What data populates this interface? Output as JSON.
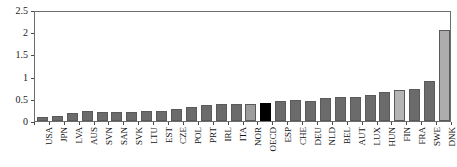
{
  "chart_data": {
    "type": "bar",
    "title": "",
    "subtitle": "",
    "xlabel": "",
    "ylabel": "",
    "ylim": [
      0,
      2.5
    ],
    "yticks": [
      0,
      0.5,
      1,
      1.5,
      2,
      2.5
    ],
    "ytick_labels": [
      "0",
      "0.5",
      "1",
      "1.5",
      "2",
      "2.5"
    ],
    "grid": false,
    "legend": null,
    "categories": [
      "USA",
      "JPN",
      "LVA",
      "AUS",
      "SVN",
      "SAN",
      "SVK",
      "LTU",
      "EST",
      "CZE",
      "POL",
      "PRT",
      "IRL",
      "ITA",
      "NOR",
      "OECD",
      "ESP",
      "CHE",
      "DEU",
      "NLD",
      "BEL",
      "AUT",
      "LUX",
      "HUN",
      "FIN",
      "FRA",
      "SWE",
      "DNK"
    ],
    "values": [
      0.1,
      0.12,
      0.17,
      0.22,
      0.2,
      0.2,
      0.2,
      0.22,
      0.23,
      0.26,
      0.31,
      0.35,
      0.39,
      0.38,
      0.39,
      0.41,
      0.46,
      0.47,
      0.46,
      0.52,
      0.53,
      0.55,
      0.58,
      0.65,
      0.7,
      0.71,
      0.9,
      2.05
    ],
    "bar_colors": [
      "#6b6b6b",
      "#6b6b6b",
      "#6b6b6b",
      "#6b6b6b",
      "#6b6b6b",
      "#6b6b6b",
      "#6b6b6b",
      "#6b6b6b",
      "#6b6b6b",
      "#6b6b6b",
      "#6b6b6b",
      "#6b6b6b",
      "#6b6b6b",
      "#6b6b6b",
      "#9d9d9d",
      "#000000",
      "#6b6b6b",
      "#6b6b6b",
      "#6b6b6b",
      "#6b6b6b",
      "#6b6b6b",
      "#6b6b6b",
      "#6b6b6b",
      "#6b6b6b",
      "#b5b5b5",
      "#6b6b6b",
      "#6b6b6b",
      "#adadad"
    ],
    "highlight_category": "OECD",
    "highlight_color": "#000000",
    "default_bar_color": "#6b6b6b",
    "axis_color": "#6d6d6d"
  }
}
